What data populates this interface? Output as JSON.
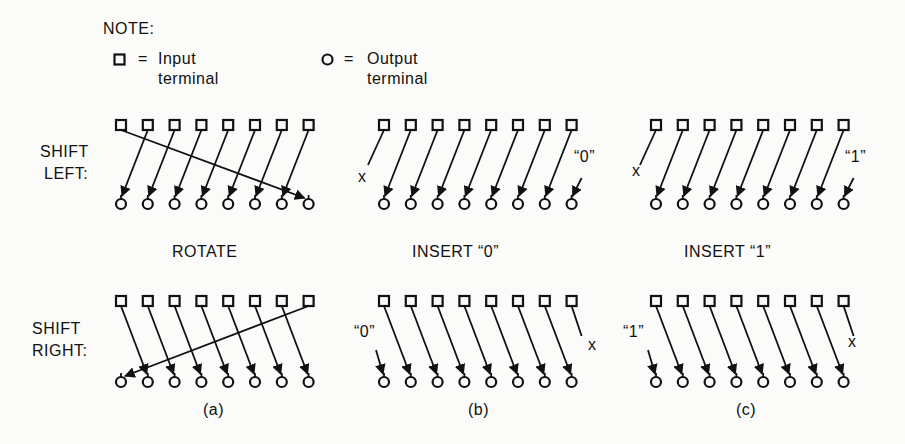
{
  "note": {
    "title": "NOTE:",
    "input_legend": {
      "symbol": "square",
      "equals": "=",
      "line1": "Input",
      "line2": "terminal"
    },
    "output_legend": {
      "symbol": "circle",
      "equals": "=",
      "line1": "Output",
      "line2": "terminal"
    }
  },
  "row_labels": {
    "shift_left": {
      "line1": "SHIFT",
      "line2": "LEFT:"
    },
    "shift_right": {
      "line1": "SHIFT",
      "line2": "RIGHT:"
    }
  },
  "column_labels": [
    "ROTATE",
    "INSERT “0”",
    "INSERT “1”"
  ],
  "panel_captions": [
    "(a)",
    "(b)",
    "(c)"
  ],
  "annotations": {
    "discard": "x",
    "insert_zero": "“0”",
    "insert_one": "“1”"
  },
  "panels": [
    {
      "id": "a",
      "mode": "rotate",
      "terminals_per_row": 8
    },
    {
      "id": "b",
      "mode": "insert-0",
      "terminals_per_row": 8
    },
    {
      "id": "c",
      "mode": "insert-1",
      "terminals_per_row": 8
    }
  ]
}
